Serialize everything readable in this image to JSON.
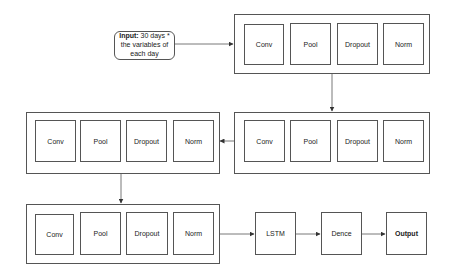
{
  "input": {
    "label_bold": "Input:",
    "label_rest": " 30 days * the variables of each day"
  },
  "blocks": [
    {
      "layers": [
        "Conv",
        "Pool",
        "Dropout",
        "Norm"
      ]
    },
    {
      "layers": [
        "Conv",
        "Pool",
        "Dropout",
        "Norm"
      ]
    },
    {
      "layers": [
        "Conv",
        "Pool",
        "Dropout",
        "Norm"
      ]
    },
    {
      "layers": [
        "Conv",
        "Pool",
        "Dropout",
        "Norm"
      ]
    }
  ],
  "head": {
    "lstm": "LSTM",
    "dense": "Dence",
    "output": "Output"
  },
  "colors": {
    "stroke": "#555555",
    "background": "#ffffff",
    "text": "#222222"
  }
}
